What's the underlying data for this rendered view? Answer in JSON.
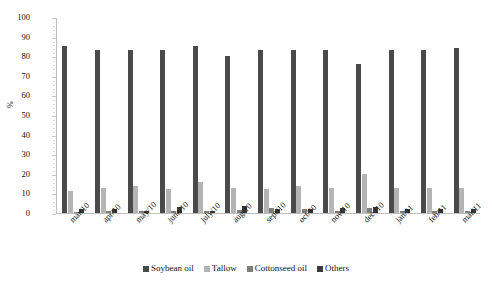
{
  "chart_data": {
    "type": "bar",
    "title": "",
    "xlabel": "",
    "ylabel": "%",
    "ylim": [
      0,
      100
    ],
    "ytick_step": 10,
    "grid": false,
    "legend_position": "bottom",
    "categories": [
      "mar/10",
      "apr/10",
      "may/10",
      "june/10",
      "july/10",
      "aug/10",
      "sept/10",
      "oct/10",
      "nov/10",
      "dec /10",
      "jan/11",
      "feb/11",
      "mar/11"
    ],
    "yticks": [
      "0",
      "10",
      "20",
      "30",
      "40",
      "50",
      "60",
      "70",
      "80",
      "90",
      "100"
    ],
    "series": [
      {
        "name": "Soybean oil",
        "color": "#4a4a4a",
        "values": [
          85,
          83,
          83,
          83,
          85,
          80,
          83,
          83,
          83,
          76,
          83,
          83,
          84
        ]
      },
      {
        "name": "Tallow",
        "color": "#b4b4b4",
        "values": [
          11,
          13,
          14,
          12,
          16,
          13,
          12,
          14,
          13,
          20,
          13,
          13,
          13
        ]
      },
      {
        "name": "Cottonseed oil",
        "color": "#7d7d7d",
        "values": [
          0.6,
          0.8,
          0.8,
          0.8,
          0.8,
          1.5,
          2.5,
          2.0,
          1.2,
          2.5,
          1.2,
          1.0,
          0.8
        ]
      },
      {
        "name": "Others",
        "color": "#3a3a3a",
        "values": [
          2.0,
          2.0,
          1.0,
          3.0,
          1.0,
          3.5,
          2.0,
          2.0,
          2.5,
          3.0,
          2.0,
          2.0,
          2.0
        ]
      }
    ]
  }
}
